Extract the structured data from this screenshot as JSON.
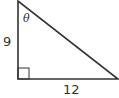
{
  "diagram": {
    "type": "right-triangle",
    "vertices": {
      "top": [
        18,
        1
      ],
      "right_angle": [
        18,
        79
      ],
      "right": [
        118,
        79
      ]
    },
    "labels": {
      "vertical_side": "9",
      "horizontal_side": "12",
      "angle": "θ"
    },
    "right_angle_marker": true,
    "stroke_color": "#333333"
  }
}
